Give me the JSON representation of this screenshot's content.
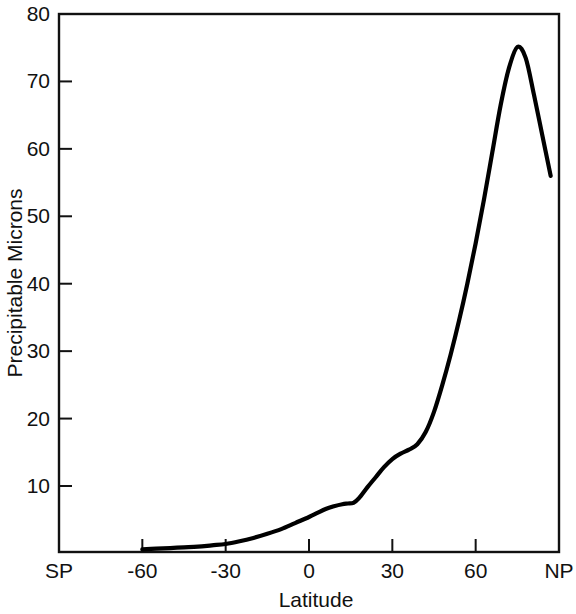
{
  "chart_data": {
    "type": "line",
    "title": "",
    "xlabel": "Latitude",
    "ylabel": "Precipitable Microns",
    "xlim": [
      -90,
      90
    ],
    "ylim": [
      0,
      80
    ],
    "grid": false,
    "legend": null,
    "x_tick_labels": [
      "SP",
      "-60",
      "-30",
      "0",
      "30",
      "60",
      "NP"
    ],
    "x_tick_values": [
      -90,
      -60,
      -30,
      0,
      30,
      60,
      90
    ],
    "y_tick_labels": [
      "10",
      "20",
      "30",
      "40",
      "50",
      "60",
      "70",
      "80"
    ],
    "y_tick_values": [
      10,
      20,
      30,
      40,
      50,
      60,
      70,
      80
    ],
    "series": [
      {
        "name": "Precipitable water vapor",
        "x": [
          -60,
          -55,
          -50,
          -45,
          -40,
          -35,
          -30,
          -25,
          -20,
          -15,
          -10,
          -5,
          0,
          3,
          6,
          9,
          12,
          14,
          16,
          18,
          21,
          24,
          27,
          30,
          33,
          36,
          39,
          42,
          45,
          48,
          51,
          54,
          57,
          60,
          63,
          66,
          69,
          72,
          75,
          78,
          81,
          84,
          87
        ],
        "y": [
          0.6,
          0.7,
          0.8,
          0.9,
          1.0,
          1.2,
          1.4,
          1.8,
          2.3,
          2.9,
          3.6,
          4.5,
          5.4,
          6.0,
          6.6,
          7.0,
          7.3,
          7.4,
          7.5,
          8.2,
          9.8,
          11.3,
          12.8,
          14.0,
          14.8,
          15.4,
          16.2,
          18.0,
          21.0,
          25.0,
          29.5,
          34.5,
          40.0,
          46.0,
          52.5,
          59.5,
          66.5,
          72.0,
          75.1,
          73.5,
          68.0,
          62.0,
          56.0
        ]
      }
    ]
  },
  "axes": {
    "x_axis_name": "latitude-axis",
    "y_axis_name": "precipitable-microns-axis"
  }
}
